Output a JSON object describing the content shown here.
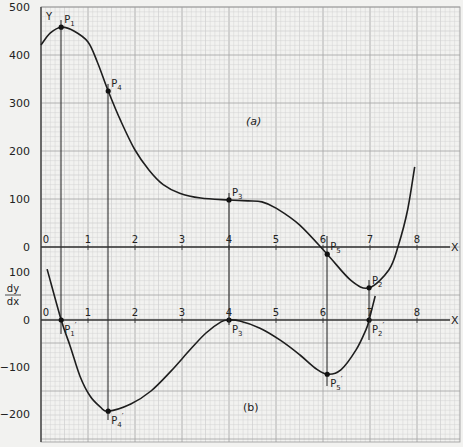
{
  "chart_data": [
    {
      "id": "a",
      "type": "line",
      "panel_label": "(a)",
      "title": "",
      "xlabel": "X",
      "ylabel": "Y",
      "x_ticks": [
        "0",
        "1",
        "2",
        "3",
        "4",
        "5",
        "6",
        "7",
        "8"
      ],
      "y_ticks": [
        "500",
        "400",
        "300",
        "200",
        "100",
        "0"
      ],
      "xlim": [
        0,
        8.9
      ],
      "ylim": [
        0,
        500
      ],
      "grid": true,
      "series": [
        {
          "name": "y",
          "x": [
            0,
            0.2,
            0.43,
            0.7,
            1.0,
            1.2,
            1.43,
            1.7,
            2.0,
            2.3,
            2.6,
            2.95,
            3.4,
            4.0,
            4.4,
            4.7,
            5.0,
            5.5,
            6.09,
            6.6,
            6.98,
            7.4,
            7.6,
            7.8,
            7.95
          ],
          "values": [
            421,
            446,
            458,
            450,
            427,
            385,
            325,
            262,
            202,
            160,
            130,
            112,
            102,
            98,
            96,
            94,
            81,
            46,
            -15,
            -70,
            -85,
            -48,
            2,
            77,
            167
          ]
        }
      ],
      "points": [
        {
          "label": "P1",
          "x": 0.43,
          "y": 458
        },
        {
          "label": "P4",
          "x": 1.43,
          "y": 325
        },
        {
          "label": "P3",
          "x": 4.0,
          "y": 98
        },
        {
          "label": "P5",
          "x": 6.09,
          "y": -15
        },
        {
          "label": "P2",
          "x": 6.98,
          "y": -85
        }
      ]
    },
    {
      "id": "b",
      "type": "line",
      "panel_label": "(b)",
      "title": "",
      "xlabel": "X",
      "ylabel": "dy/dx",
      "x_ticks": [
        "0",
        "1",
        "2",
        "3",
        "4",
        "5",
        "6",
        "7",
        "8"
      ],
      "y_ticks": [
        "100",
        "0",
        "-100",
        "-200"
      ],
      "xlim": [
        0,
        8.9
      ],
      "ylim": [
        -250,
        100
      ],
      "grid": true,
      "series": [
        {
          "name": "dy/dx",
          "x": [
            0.13,
            0.43,
            0.62,
            0.83,
            1.04,
            1.26,
            1.43,
            1.91,
            2.34,
            2.77,
            3.19,
            3.51,
            3.83,
            4.0,
            4.23,
            4.66,
            5.09,
            5.51,
            5.83,
            6.09,
            6.38,
            6.7,
            6.91,
            6.98,
            7.11
          ],
          "values": [
            106,
            0,
            -54,
            -117,
            -158,
            -181,
            -190,
            -175,
            -148,
            -106,
            -60,
            -27,
            -4,
            0,
            -2,
            -17,
            -42,
            -73,
            -100,
            -113,
            -104,
            -63,
            -21,
            0,
            50
          ]
        }
      ],
      "points": [
        {
          "label": "P1'",
          "x": 0.43,
          "y": 0
        },
        {
          "label": "P4'",
          "x": 1.43,
          "y": -190
        },
        {
          "label": "P3'",
          "x": 4.0,
          "y": 0
        },
        {
          "label": "P5'",
          "x": 6.09,
          "y": -113
        },
        {
          "label": "P2'",
          "x": 6.98,
          "y": 0
        }
      ]
    }
  ],
  "labels": {
    "y_axis_a": "Y",
    "y_axis_b_num": "dy",
    "y_axis_b_den": "dx",
    "x_axis": "X",
    "panel_a": "(a)",
    "panel_b": "(b)",
    "left_ticks_a": [
      "500",
      "400",
      "300",
      "200",
      "100",
      "0"
    ],
    "left_ticks_b": [
      "100",
      "0",
      "−100",
      "−200"
    ],
    "x_ticks": [
      "0",
      "1",
      "2",
      "3",
      "4",
      "5",
      "6",
      "7",
      "8"
    ],
    "points_a": [
      "P1",
      "P4",
      "P3",
      "P5",
      "P2"
    ],
    "points_b": [
      "P1'",
      "P4'",
      "P3'",
      "P5'",
      "P2'"
    ]
  },
  "colors": {
    "paper": "#f2f2f0",
    "grid_minor": "#cfcfcf",
    "grid_major": "#a9a9a9",
    "ink": "#1e1e1e"
  }
}
